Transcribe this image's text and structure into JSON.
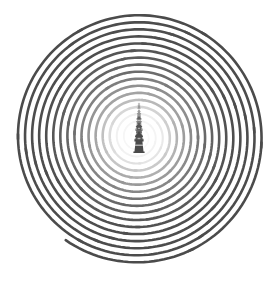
{
  "artwork": {
    "title": "Spiral with Lighthouse Scale Progression",
    "canvas": {
      "width": 278,
      "height": 281,
      "background_color": "#ffffff"
    },
    "spiral": {
      "name": "archimedean-spiral",
      "center_x": 138,
      "center_y": 137,
      "turns": 17,
      "inner_radius": 6,
      "outer_radius": 126,
      "stroke_width": 2.6,
      "stroke_color": "#4b4b4b",
      "fade_color_inner": "#f2f2f2",
      "direction": "counterclockwise-outward",
      "end_angle_deg": 35,
      "description": "Continuous spiral line fading from light gray at center to dark gray at outer edge"
    },
    "towers": {
      "name": "lighthouse-progression",
      "count": 5,
      "color": "#4a4a4a",
      "center_x": 139,
      "description": "Five lighthouse silhouettes increasing in size from top to bottom",
      "items": [
        {
          "label": "lighthouse-1-smallest",
          "cy": 109,
          "scale": 0.3,
          "opacity": 0.42
        },
        {
          "label": "lighthouse-2",
          "cy": 119,
          "scale": 0.45,
          "opacity": 0.55
        },
        {
          "label": "lighthouse-3",
          "cy": 129.5,
          "scale": 0.62,
          "opacity": 0.7
        },
        {
          "label": "lighthouse-4",
          "cy": 140,
          "scale": 0.8,
          "opacity": 0.84
        },
        {
          "label": "lighthouse-5-largest",
          "cy": 153,
          "scale": 1.0,
          "opacity": 1.0
        }
      ]
    },
    "palette": {
      "line_dark": "#4b4b4b",
      "line_mid": "#8c8c8c",
      "line_light": "#dcdcdc",
      "tower_fill": "#4a4a4a",
      "background": "#ffffff"
    }
  }
}
